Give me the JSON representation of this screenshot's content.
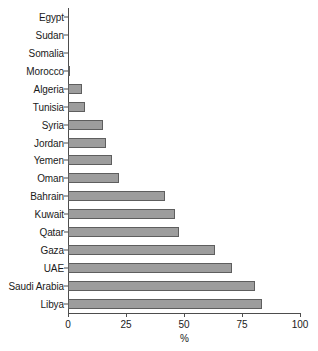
{
  "chart_data": {
    "type": "bar",
    "orientation": "horizontal",
    "title": "",
    "xlabel": "%",
    "ylabel": "",
    "xlim": [
      0,
      100
    ],
    "xticks": [
      0,
      25,
      50,
      75,
      100
    ],
    "xtick_labels": [
      "0",
      "25",
      "50",
      "75",
      "100"
    ],
    "grid": false,
    "legend": false,
    "bar_color": "#9d9d9d",
    "bar_edge_color": "#5e5e5e",
    "axis_color": "#4d4d4d",
    "categories": [
      "Egypt",
      "Sudan",
      "Somalia",
      "Morocco",
      "Algeria",
      "Tunisia",
      "Syria",
      "Jordan",
      "Yemen",
      "Oman",
      "Bahrain",
      "Kuwait",
      "Qatar",
      "Gaza",
      "UAE",
      "Saudi Arabia",
      "Libya"
    ],
    "values": [
      0,
      0,
      0,
      1,
      6,
      7.5,
      15,
      16.5,
      19,
      22,
      42,
      46,
      48,
      63.5,
      70.5,
      80.5,
      83.5
    ]
  }
}
